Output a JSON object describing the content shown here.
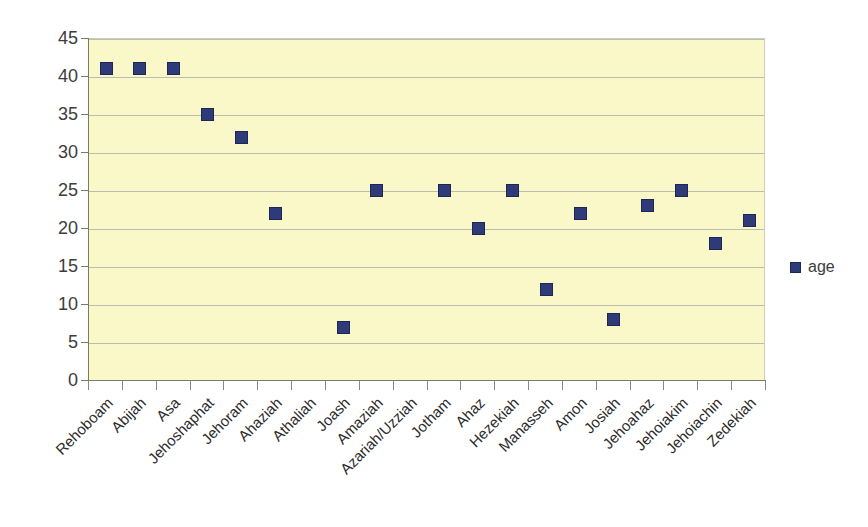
{
  "chart_data": {
    "type": "scatter",
    "title": "",
    "xlabel": "",
    "ylabel": "",
    "ylim": [
      0,
      45
    ],
    "ytick_step": 5,
    "yticks": [
      0,
      5,
      10,
      15,
      20,
      25,
      30,
      35,
      40,
      45
    ],
    "ytick_labels": [
      "0",
      "5",
      "10",
      "15",
      "20",
      "25",
      "30",
      "35",
      "40",
      "45"
    ],
    "grid": true,
    "legend_position": "right",
    "categories": [
      "Rehoboam",
      "Abijah",
      "Asa",
      "Jehoshaphat",
      "Jehoram",
      "Ahaziah",
      "Athaliah",
      "Joash",
      "Amaziah",
      "Azariah/Uzziah",
      "Jotham",
      "Ahaz",
      "Hezekiah",
      "Manasseh",
      "Amon",
      "Josiah",
      "Jehoahaz",
      "Jehoiakim",
      "Jehoiachin",
      "Zedekiah"
    ],
    "series": [
      {
        "name": "age",
        "color": "#2f3b78",
        "marker": "square",
        "values": [
          41,
          41,
          41,
          35,
          32,
          22,
          null,
          7,
          25,
          null,
          25,
          20,
          25,
          12,
          22,
          8,
          23,
          25,
          18,
          21
        ]
      }
    ],
    "plot_background": "#faf8c8",
    "gridline_color": "#b9bfb0",
    "axis_color": "#7a7a6a"
  },
  "legend": {
    "entries": [
      {
        "label": "age",
        "color": "#2f3b78"
      }
    ]
  }
}
